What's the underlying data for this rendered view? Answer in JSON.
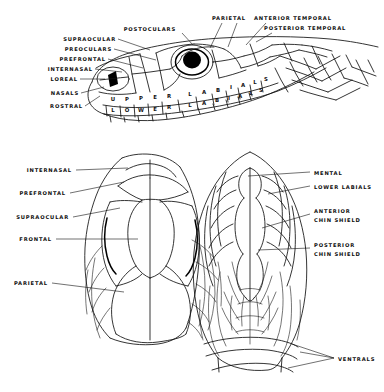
{
  "figure": {
    "views": [
      {
        "id": "lateral",
        "name": "lateral-head-view"
      },
      {
        "id": "dorsal",
        "name": "dorsal-head-view"
      },
      {
        "id": "ventral",
        "name": "ventral-head-view"
      }
    ]
  },
  "lateral": {
    "labels_left": [
      {
        "text": "SUPRAOCULAR",
        "x": 116,
        "y": 41
      },
      {
        "text": "PREOCULARS",
        "x": 112,
        "y": 51
      },
      {
        "text": "PREFRONTAL",
        "x": 106,
        "y": 61
      },
      {
        "text": "INTERNASAL",
        "x": 93,
        "y": 71
      },
      {
        "text": "LOREAL",
        "x": 78,
        "y": 81
      },
      {
        "text": "NASALS",
        "x": 79,
        "y": 95
      },
      {
        "text": "ROSTRAL",
        "x": 83,
        "y": 108
      }
    ],
    "labels_top": [
      {
        "text": "POSTOCULARS",
        "x": 176,
        "y": 31
      },
      {
        "text": "PARIETAL",
        "x": 227,
        "y": 20
      },
      {
        "text": "ANTERIOR TEMPORAL",
        "x": 290,
        "y": 20
      },
      {
        "text": "POSTERIOR TEMPORAL",
        "x": 303,
        "y": 30
      }
    ],
    "upper_labials_text": "UPPER LABIALS",
    "lower_labials_text": "LOWER LABIALS",
    "upper_labials_letters": [
      {
        "c": "U",
        "x": 113,
        "y": 99
      },
      {
        "c": "P",
        "x": 127,
        "y": 99
      },
      {
        "c": "P",
        "x": 141,
        "y": 99
      },
      {
        "c": "E",
        "x": 155,
        "y": 98
      },
      {
        "c": "R",
        "x": 169,
        "y": 98
      },
      {
        "c": "L",
        "x": 190,
        "y": 97
      },
      {
        "c": "A",
        "x": 204,
        "y": 96
      },
      {
        "c": "B",
        "x": 218,
        "y": 95
      },
      {
        "c": "I",
        "x": 231,
        "y": 94
      },
      {
        "c": "A",
        "x": 243,
        "y": 93
      },
      {
        "c": "L",
        "x": 255,
        "y": 92
      },
      {
        "c": "S",
        "x": 266,
        "y": 90
      }
    ],
    "lower_labials_letters": [
      {
        "c": "L",
        "x": 113,
        "y": 110
      },
      {
        "c": "O",
        "x": 127,
        "y": 110
      },
      {
        "c": "W",
        "x": 141,
        "y": 110
      },
      {
        "c": "E",
        "x": 155,
        "y": 109
      },
      {
        "c": "R",
        "x": 169,
        "y": 108
      },
      {
        "c": "L",
        "x": 190,
        "y": 107
      },
      {
        "c": "A",
        "x": 204,
        "y": 106
      },
      {
        "c": "B",
        "x": 217,
        "y": 105
      },
      {
        "c": "I",
        "x": 229,
        "y": 104
      },
      {
        "c": "A",
        "x": 240,
        "y": 103
      },
      {
        "c": "L",
        "x": 251,
        "y": 101
      },
      {
        "c": "S",
        "x": 261,
        "y": 99
      }
    ]
  },
  "dorsal": {
    "labels": [
      {
        "text": "INTERNASAL",
        "x": 72,
        "y": 172
      },
      {
        "text": "PREFRONTAL",
        "x": 66,
        "y": 195
      },
      {
        "text": "SUPRAOCULAR",
        "x": 69,
        "y": 219
      },
      {
        "text": "FRONTAL",
        "x": 52,
        "y": 241
      },
      {
        "text": "PARIETAL",
        "x": 48,
        "y": 285
      }
    ]
  },
  "ventral": {
    "labels": [
      {
        "text": "MENTAL",
        "x": 312,
        "y": 174
      },
      {
        "text": "LOWER LABIALS",
        "x": 312,
        "y": 189
      },
      {
        "text": "ANTERIOR",
        "x": 312,
        "y": 212
      },
      {
        "text": "CHIN SHIELD",
        "x": 312,
        "y": 221
      },
      {
        "text": "POSTERIOR",
        "x": 312,
        "y": 246
      },
      {
        "text": "CHIN SHIELD",
        "x": 312,
        "y": 255
      },
      {
        "text": "VENTRALS",
        "x": 336,
        "y": 361
      }
    ]
  },
  "colors": {
    "ink": "#111111",
    "background": "#ffffff",
    "pupil": "#000000"
  }
}
